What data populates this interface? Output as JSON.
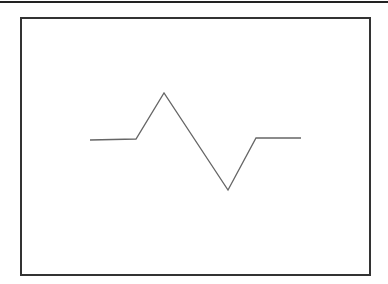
{
  "diagram": {
    "stroke_color": "#666666",
    "frame_color": "#333333",
    "waveform_points": [
      [
        90,
        140
      ],
      [
        136,
        139
      ],
      [
        164,
        93
      ],
      [
        228,
        190
      ],
      [
        256,
        138
      ],
      [
        301,
        138
      ]
    ]
  }
}
